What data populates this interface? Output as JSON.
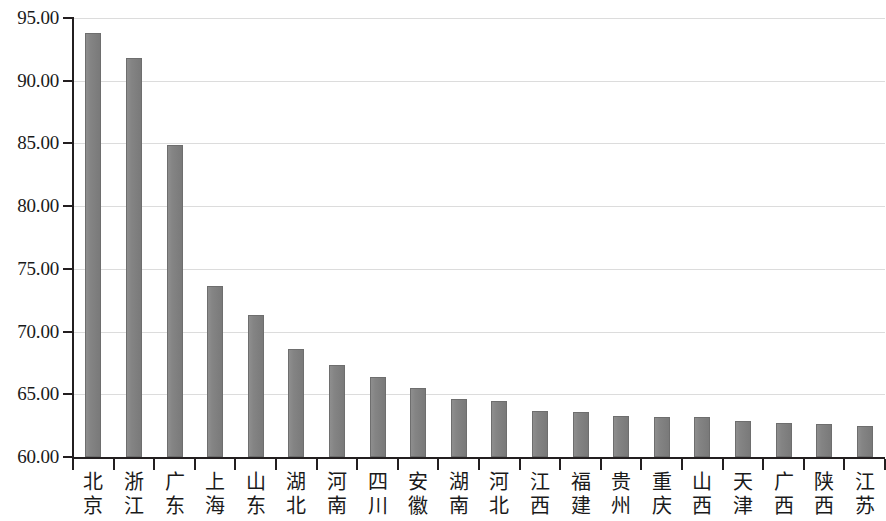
{
  "chart_data": {
    "type": "bar",
    "title": "",
    "subtitle": "",
    "xlabel": "",
    "ylabel": "",
    "ylim": [
      60.0,
      95.0
    ],
    "ytick_step": 5.0,
    "grid": true,
    "legend": null,
    "legend_position": "none",
    "bar_color": "#818181",
    "bar_edge_color": "#6e6e6e",
    "gridline_color": "#dcdcdc",
    "axis_color": "#231f20",
    "yticks": [
      "60.00",
      "65.00",
      "70.00",
      "75.00",
      "80.00",
      "85.00",
      "90.00",
      "95.00"
    ],
    "ytick_values": [
      60.0,
      65.0,
      70.0,
      75.0,
      80.0,
      85.0,
      90.0,
      95.0
    ],
    "categories": [
      "北京",
      "浙江",
      "广东",
      "上海",
      "山东",
      "湖北",
      "河南",
      "四川",
      "安徽",
      "湖南",
      "河北",
      "江西",
      "福建",
      "贵州",
      "重庆",
      "山西",
      "天津",
      "广西",
      "陕西",
      "江苏"
    ],
    "category_lines": [
      [
        "北",
        "京"
      ],
      [
        "浙",
        "江"
      ],
      [
        "广",
        "东"
      ],
      [
        "上",
        "海"
      ],
      [
        "山",
        "东"
      ],
      [
        "湖",
        "北"
      ],
      [
        "河",
        "南"
      ],
      [
        "四",
        "川"
      ],
      [
        "安",
        "徽"
      ],
      [
        "湖",
        "南"
      ],
      [
        "河",
        "北"
      ],
      [
        "江",
        "西"
      ],
      [
        "福",
        "建"
      ],
      [
        "贵",
        "州"
      ],
      [
        "重",
        "庆"
      ],
      [
        "山",
        "西"
      ],
      [
        "天",
        "津"
      ],
      [
        "广",
        "西"
      ],
      [
        "陕",
        "西"
      ],
      [
        "江",
        "苏"
      ]
    ],
    "values": [
      93.8,
      91.8,
      84.9,
      73.6,
      71.35,
      68.65,
      67.3,
      66.4,
      65.5,
      64.65,
      64.5,
      63.65,
      63.6,
      63.3,
      63.2,
      63.15,
      62.85,
      62.7,
      62.6,
      62.45
    ]
  }
}
